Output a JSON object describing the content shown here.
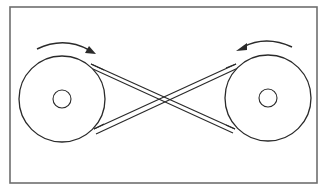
{
  "diagram": {
    "colors": {
      "stroke": "#2a2a2a",
      "frame": "#6e6e6e",
      "background": "#ffffff"
    },
    "frame": {
      "x": 10,
      "y": 7,
      "width": 307,
      "height": 176
    },
    "pulleys": [
      {
        "name": "left-pulley",
        "cx": 62,
        "cy": 99,
        "r": 43,
        "hub_r": 9,
        "rotation": "clockwise"
      },
      {
        "name": "right-pulley",
        "cx": 268,
        "cy": 98,
        "r": 43,
        "hub_r": 9,
        "rotation": "counterclockwise"
      }
    ],
    "belt": {
      "type": "crossed",
      "crossing_point": {
        "x": 163,
        "y": 97
      }
    },
    "arrows": [
      {
        "name": "left-rotation-arrow",
        "direction": "clockwise"
      },
      {
        "name": "right-rotation-arrow",
        "direction": "counterclockwise"
      }
    ]
  }
}
